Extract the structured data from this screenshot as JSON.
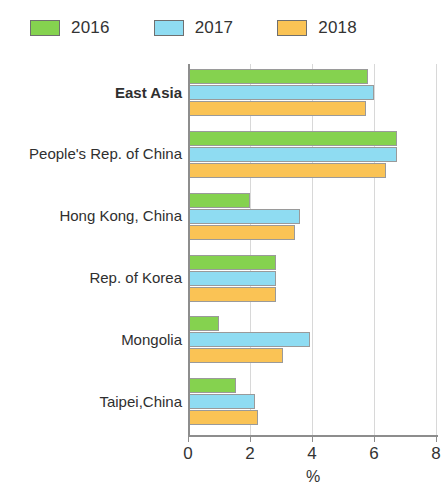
{
  "legend": {
    "items": [
      {
        "label": "2016",
        "color": "#85d24f",
        "icon": "legend-swatch-2016"
      },
      {
        "label": "2017",
        "color": "#8fdcf2",
        "icon": "legend-swatch-2017"
      },
      {
        "label": "2018",
        "color": "#fac355",
        "icon": "legend-swatch-2018"
      }
    ]
  },
  "chart_data": {
    "type": "bar",
    "orientation": "horizontal",
    "title": "",
    "subtitle": "",
    "xlabel": "%",
    "ylabel": "",
    "xlim": [
      0,
      8
    ],
    "xticks": [
      0,
      2,
      4,
      6,
      8
    ],
    "xtick_labels": [
      "0",
      "2",
      "4",
      "6",
      "8"
    ],
    "grid": true,
    "grid_axis": "x",
    "legend_position": "top-left",
    "categories": [
      "East Asia",
      "People's Rep. of China",
      "Hong Kong, China",
      "Rep. of Korea",
      "Mongolia",
      "Taipei,China"
    ],
    "category_emphasis": [
      true,
      false,
      false,
      false,
      false,
      false
    ],
    "series": [
      {
        "name": "2016",
        "color": "#85d24f",
        "values": [
          5.8,
          6.75,
          2.0,
          2.85,
          1.0,
          1.55
        ]
      },
      {
        "name": "2017",
        "color": "#8fdcf2",
        "values": [
          6.0,
          6.75,
          3.6,
          2.85,
          3.95,
          2.15
        ]
      },
      {
        "name": "2018",
        "color": "#fac355",
        "values": [
          5.75,
          6.4,
          3.45,
          2.85,
          3.05,
          2.25
        ]
      }
    ]
  }
}
